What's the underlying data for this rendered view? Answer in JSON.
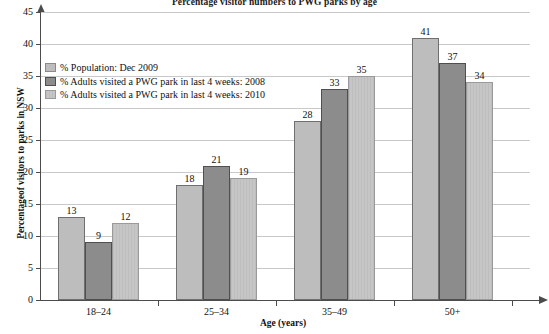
{
  "chart_data": {
    "type": "bar",
    "title": "Percentage visitor numbers to PWG parks by age",
    "xlabel": "Age (years)",
    "ylabel": "Percentageof visitors to parks in NSW",
    "categories": [
      "18–24",
      "25–34",
      "35–49",
      "50+"
    ],
    "series": [
      {
        "name": "% Population: Dec 2009",
        "color": "#bdbdbd",
        "values": [
          13,
          18,
          28,
          41
        ]
      },
      {
        "name": "% Adults visited a PWG park in last 4 weeks: 2008",
        "color": "#8c8c8c",
        "values": [
          9,
          21,
          33,
          37
        ]
      },
      {
        "name": "% Adults visited a PWG park in last 4 weeks: 2010",
        "color": "#c6c6c6",
        "values": [
          12,
          19,
          35,
          34
        ]
      }
    ],
    "ylim": [
      0,
      45
    ],
    "yticks": [
      0,
      5,
      10,
      15,
      20,
      25,
      30,
      35,
      40,
      45
    ],
    "ytick_labels": [
      "0",
      "5",
      "10",
      "15",
      "20",
      "25",
      "30",
      "35",
      "40",
      "45"
    ],
    "grid": true,
    "legend_position": "upper left",
    "data_labels": true
  }
}
